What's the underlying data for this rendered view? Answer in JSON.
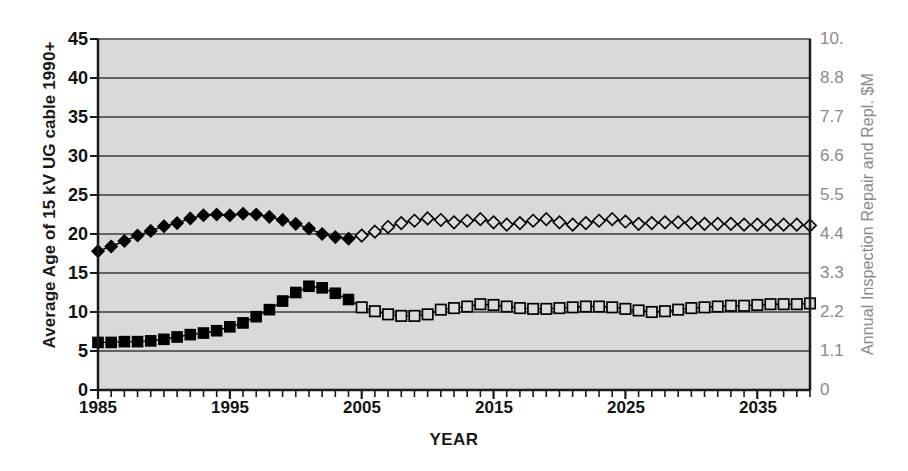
{
  "chart_data": {
    "type": "line",
    "title": "",
    "xlabel": "YEAR",
    "ylabel": "Average Age of 15 kV UG cable 1990+",
    "y2label": "Annual Inspection Repair and Repl. $M",
    "xlim": [
      1985,
      2039
    ],
    "ylim": [
      0,
      45
    ],
    "y2lim": [
      0,
      10
    ],
    "grid": true,
    "legend": "none",
    "x_tick_labels": [
      "1985",
      "1995",
      "2005",
      "2015",
      "2025",
      "2035"
    ],
    "x_tick_values": [
      1985,
      1995,
      2005,
      2015,
      2025,
      2035
    ],
    "y_tick_labels": [
      "0",
      "5",
      "10",
      "15",
      "20",
      "25",
      "30",
      "35",
      "40",
      "45"
    ],
    "y_tick_values": [
      0,
      5,
      10,
      15,
      20,
      25,
      30,
      35,
      40,
      45
    ],
    "y2_tick_labels": [
      "0",
      "1.1",
      "2.2",
      "3.3",
      "4.4",
      "5.5",
      "6.6",
      "7.7",
      "8.8",
      "10."
    ],
    "y2_tick_values": [
      0,
      1.1,
      2.2,
      3.3,
      4.4,
      5.5,
      6.6,
      7.7,
      8.8,
      10.0
    ],
    "x": [
      1985,
      1986,
      1987,
      1988,
      1989,
      1990,
      1991,
      1992,
      1993,
      1994,
      1995,
      1996,
      1997,
      1998,
      1999,
      2000,
      2001,
      2002,
      2003,
      2004,
      2005,
      2006,
      2007,
      2008,
      2009,
      2010,
      2011,
      2012,
      2013,
      2014,
      2015,
      2016,
      2017,
      2018,
      2019,
      2020,
      2021,
      2022,
      2023,
      2024,
      2025,
      2026,
      2027,
      2028,
      2029,
      2030,
      2031,
      2032,
      2033,
      2034,
      2035,
      2036,
      2037,
      2038,
      2039
    ],
    "series": [
      {
        "name": "Average Age of 15 kV UG cable 1990+",
        "axis": "left",
        "marker": "diamond",
        "historical_marker": "filled-diamond",
        "forecast_marker": "open-diamond",
        "forecast_start_year": 2005,
        "values": [
          17.8,
          18.4,
          19.1,
          19.8,
          20.4,
          21.0,
          21.4,
          22.0,
          22.4,
          22.5,
          22.4,
          22.6,
          22.5,
          22.2,
          21.8,
          21.3,
          20.7,
          20.0,
          19.6,
          19.4,
          19.8,
          20.3,
          20.9,
          21.4,
          21.7,
          22.0,
          21.8,
          21.5,
          21.7,
          21.9,
          21.5,
          21.2,
          21.4,
          21.7,
          21.9,
          21.5,
          21.2,
          21.4,
          21.7,
          21.9,
          21.6,
          21.3,
          21.4,
          21.5,
          21.5,
          21.4,
          21.3,
          21.3,
          21.3,
          21.2,
          21.2,
          21.2,
          21.2,
          21.2,
          21.1
        ]
      },
      {
        "name": "Annual Inspection Repair and Repl. $M",
        "axis": "right",
        "marker": "square",
        "historical_marker": "filled-square",
        "forecast_marker": "open-square",
        "forecast_start_year": 2005,
        "values_left_scale": [
          6.1,
          6.1,
          6.2,
          6.2,
          6.3,
          6.5,
          6.8,
          7.1,
          7.3,
          7.6,
          8.1,
          8.6,
          9.4,
          10.3,
          11.4,
          12.5,
          13.3,
          13.1,
          12.4,
          11.6,
          10.6,
          10.1,
          9.7,
          9.5,
          9.5,
          9.7,
          10.3,
          10.5,
          10.7,
          11.0,
          10.9,
          10.7,
          10.5,
          10.4,
          10.4,
          10.5,
          10.6,
          10.7,
          10.7,
          10.6,
          10.4,
          10.2,
          10.0,
          10.1,
          10.3,
          10.5,
          10.6,
          10.7,
          10.8,
          10.8,
          10.9,
          11.0,
          11.0,
          11.0,
          11.1
        ],
        "values": [
          1.36,
          1.36,
          1.38,
          1.38,
          1.4,
          1.44,
          1.51,
          1.58,
          1.62,
          1.69,
          1.8,
          1.91,
          2.09,
          2.29,
          2.53,
          2.78,
          2.96,
          2.91,
          2.76,
          2.58,
          2.36,
          2.24,
          2.16,
          2.11,
          2.11,
          2.16,
          2.29,
          2.33,
          2.38,
          2.44,
          2.42,
          2.38,
          2.33,
          2.31,
          2.31,
          2.33,
          2.36,
          2.38,
          2.38,
          2.36,
          2.31,
          2.27,
          2.22,
          2.24,
          2.29,
          2.33,
          2.36,
          2.38,
          2.4,
          2.4,
          2.42,
          2.44,
          2.44,
          2.44,
          2.47
        ]
      }
    ]
  },
  "style": {
    "plot_background": "#d9d9d9",
    "gridline_color": "#3b3b3b",
    "axis_color": "#1a1a1a",
    "right_axis_text_color": "#8a8a8a",
    "series_color": "#000000"
  }
}
